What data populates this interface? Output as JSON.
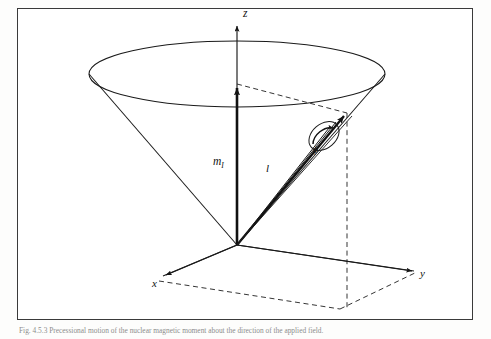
{
  "figure": {
    "type": "vector-model-cone-diagram",
    "frame": {
      "x": 17,
      "y": 8,
      "width": 456,
      "height": 312,
      "border_color": "#3a3a3a"
    },
    "background": "#ffffff",
    "stroke_color": "#1a1a1a",
    "labels": {
      "z_axis": "z",
      "x_axis": "x",
      "y_axis": "y",
      "moment_vector": "m",
      "moment_subscript": "I",
      "length_vector": "l",
      "precession_angle": "ϕ"
    },
    "geometry": {
      "apex": {
        "x": 237,
        "y": 245
      },
      "cone_ellipse": {
        "cx": 237,
        "cy": 74,
        "rx": 148,
        "ry": 33
      },
      "z_arrow_tip": {
        "x": 237,
        "y": 22
      },
      "z_arrow_short_tip": {
        "x": 237,
        "y": 84
      },
      "tip_point": {
        "x": 347,
        "y": 113
      },
      "x_arrow_tip": {
        "x": 161,
        "y": 277
      },
      "y_arrow_tip": {
        "x": 417,
        "y": 272
      },
      "base_parallelogram": [
        {
          "x": 237,
          "y": 245
        },
        {
          "x": 417,
          "y": 272
        },
        {
          "x": 340,
          "y": 309
        },
        {
          "x": 159,
          "y": 281
        }
      ],
      "drop_line": {
        "from": {
          "x": 347,
          "y": 113
        },
        "to": {
          "x": 347,
          "y": 309
        }
      }
    }
  },
  "caption": {
    "number": "Fig. 4.5.3",
    "text": "Fig. 4.5.3  Precessional motion of the nuclear magnetic moment about the direction of the applied field."
  }
}
